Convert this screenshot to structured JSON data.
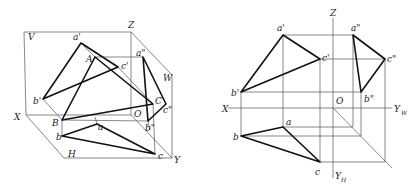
{
  "figure": {
    "left_diagram": {
      "title": "pictorial-projection-system",
      "planes": {
        "V": "V",
        "W": "W",
        "H": "H"
      },
      "axes": {
        "X": "X",
        "Y": "Y",
        "Z": "Z",
        "O": "O"
      },
      "space_points": {
        "A": "A",
        "B": "B",
        "C": "C"
      },
      "front_view": {
        "a": "a'",
        "b": "b'",
        "c": "c'"
      },
      "top_view": {
        "a": "a",
        "b": "b",
        "c": "c"
      },
      "side_view": {
        "a": "a\"",
        "b": "b\"",
        "c": "c\""
      }
    },
    "right_diagram": {
      "title": "unfolded-three-view-projection",
      "axes": {
        "X": "X",
        "Z": "Z",
        "O": "O",
        "YW": "Y",
        "YW_sub": "W",
        "YH": "Y",
        "YH_sub": "H"
      },
      "front_view": {
        "a": "a'",
        "b": "b'",
        "c": "c'"
      },
      "top_view": {
        "a": "a",
        "b": "b",
        "c": "c"
      },
      "side_view": {
        "a": "a\"",
        "b": "b\"",
        "c": "c\""
      }
    },
    "colors": {
      "line": "#111111",
      "thin_line": "#555555",
      "background": "#ffffff"
    }
  }
}
